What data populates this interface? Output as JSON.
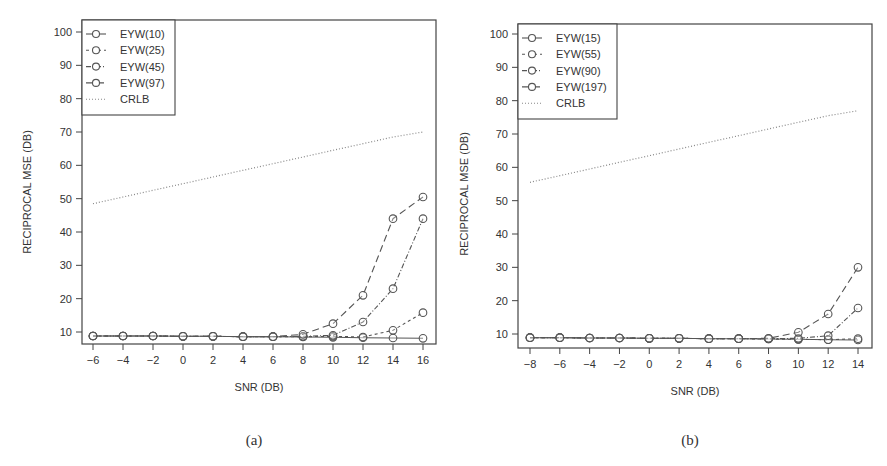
{
  "chart_data": [
    {
      "id": "a",
      "type": "line",
      "caption": "(a)",
      "xlabel": "SNR (DB)",
      "ylabel": "RECIPROCAL MSE (DB)",
      "x": [
        -6,
        -4,
        -2,
        0,
        2,
        4,
        6,
        8,
        10,
        12,
        14,
        16
      ],
      "xticks": [
        -6,
        -4,
        -2,
        0,
        2,
        4,
        6,
        8,
        10,
        12,
        14,
        16
      ],
      "yticks": [
        10,
        20,
        30,
        40,
        50,
        60,
        70,
        80,
        90,
        100
      ],
      "xlim": [
        -6,
        16
      ],
      "ylim": [
        10,
        100
      ],
      "grid": false,
      "legend_position": "top-left",
      "series": [
        {
          "name": "EYW(10)",
          "style": "solid",
          "marker": "circle",
          "values": [
            8.8,
            8.8,
            8.8,
            8.7,
            8.7,
            8.6,
            8.6,
            8.5,
            8.4,
            8.3,
            8.2,
            8.1
          ]
        },
        {
          "name": "EYW(25)",
          "style": "short-dash",
          "marker": "circle",
          "values": [
            8.8,
            8.8,
            8.8,
            8.7,
            8.7,
            8.6,
            8.6,
            8.6,
            8.7,
            8.5,
            10.5,
            15.8
          ]
        },
        {
          "name": "EYW(45)",
          "style": "dash-dot",
          "marker": "circle",
          "values": [
            8.8,
            8.8,
            8.8,
            8.7,
            8.7,
            8.6,
            8.6,
            8.7,
            9.0,
            13.0,
            23.0,
            44.0
          ]
        },
        {
          "name": "EYW(97)",
          "style": "long-dash",
          "marker": "circle",
          "values": [
            8.8,
            8.8,
            8.8,
            8.7,
            8.7,
            8.6,
            8.6,
            9.3,
            12.5,
            21.0,
            44.0,
            50.5
          ]
        },
        {
          "name": "CRLB",
          "style": "dotted",
          "marker": "none",
          "values": [
            48.5,
            50.5,
            52.5,
            54.5,
            56.5,
            58.5,
            60.5,
            62.5,
            64.5,
            66.5,
            68.5,
            70.0
          ]
        }
      ]
    },
    {
      "id": "b",
      "type": "line",
      "caption": "(b)",
      "xlabel": "SNR (DB)",
      "ylabel": "RECIPROCAL MSE (DB)",
      "x": [
        -8,
        -6,
        -4,
        -2,
        0,
        2,
        4,
        6,
        8,
        10,
        12,
        14
      ],
      "xticks": [
        -8,
        -6,
        -4,
        -2,
        0,
        2,
        4,
        6,
        8,
        10,
        12,
        14
      ],
      "yticks": [
        10,
        20,
        30,
        40,
        50,
        60,
        70,
        80,
        90,
        100
      ],
      "xlim": [
        -8,
        14
      ],
      "ylim": [
        10,
        100
      ],
      "grid": false,
      "legend_position": "top-left",
      "series": [
        {
          "name": "EYW(15)",
          "style": "solid",
          "marker": "circle",
          "values": [
            8.9,
            8.9,
            8.8,
            8.8,
            8.7,
            8.7,
            8.6,
            8.6,
            8.5,
            8.4,
            8.3,
            8.2
          ]
        },
        {
          "name": "EYW(55)",
          "style": "short-dash",
          "marker": "circle",
          "values": [
            8.9,
            8.9,
            8.8,
            8.8,
            8.7,
            8.7,
            8.6,
            8.6,
            8.5,
            8.4,
            8.3,
            8.6
          ]
        },
        {
          "name": "EYW(90)",
          "style": "dash-dot",
          "marker": "circle",
          "values": [
            8.9,
            8.9,
            8.8,
            8.8,
            8.7,
            8.7,
            8.6,
            8.6,
            8.6,
            8.7,
            9.5,
            17.8
          ]
        },
        {
          "name": "EYW(197)",
          "style": "long-dash",
          "marker": "circle",
          "values": [
            8.9,
            8.9,
            8.8,
            8.8,
            8.7,
            8.7,
            8.6,
            8.6,
            8.7,
            10.5,
            16.0,
            30.0
          ]
        },
        {
          "name": "CRLB",
          "style": "dotted",
          "marker": "none",
          "values": [
            55.5,
            57.5,
            59.5,
            61.5,
            63.5,
            65.5,
            67.5,
            69.5,
            71.5,
            73.5,
            75.5,
            77.0
          ]
        }
      ]
    }
  ]
}
